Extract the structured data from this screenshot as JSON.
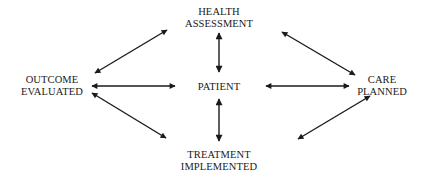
{
  "diagram": {
    "type": "hub-and-cycle",
    "center": {
      "id": "patient",
      "lines": [
        "PATIENT"
      ]
    },
    "nodes": [
      {
        "id": "health_assessment",
        "lines": [
          "HEALTH",
          "ASSESSMENT"
        ],
        "position": "top"
      },
      {
        "id": "care_planned",
        "lines": [
          "CARE",
          "PLANNED"
        ],
        "position": "right"
      },
      {
        "id": "treatment_implemented",
        "lines": [
          "TREATMENT",
          "IMPLEMENTED"
        ],
        "position": "bottom"
      },
      {
        "id": "outcome_evaluated",
        "lines": [
          "OUTCOME",
          "EVALUATED"
        ],
        "position": "left"
      }
    ],
    "edges": [
      {
        "from": "outcome_evaluated",
        "to": "health_assessment",
        "bidirectional": true
      },
      {
        "from": "health_assessment",
        "to": "care_planned",
        "bidirectional": true
      },
      {
        "from": "care_planned",
        "to": "treatment_implemented",
        "bidirectional": true
      },
      {
        "from": "treatment_implemented",
        "to": "outcome_evaluated",
        "bidirectional": true
      },
      {
        "from": "patient",
        "to": "health_assessment",
        "bidirectional": true
      },
      {
        "from": "patient",
        "to": "care_planned",
        "bidirectional": true
      },
      {
        "from": "patient",
        "to": "treatment_implemented",
        "bidirectional": true
      },
      {
        "from": "patient",
        "to": "outcome_evaluated",
        "bidirectional": true
      }
    ],
    "colors": {
      "arrow": "#1a1a1a",
      "text": "#1a1a1a",
      "background": "#ffffff"
    }
  },
  "labels": {
    "health_1": "HEALTH",
    "health_2": "ASSESSMENT",
    "patient": "PATIENT",
    "care_1": "CARE",
    "care_2": "PLANNED",
    "treatment_1": "TREATMENT",
    "treatment_2": "IMPLEMENTED",
    "outcome_1": "OUTCOME",
    "outcome_2": "EVALUATED"
  }
}
